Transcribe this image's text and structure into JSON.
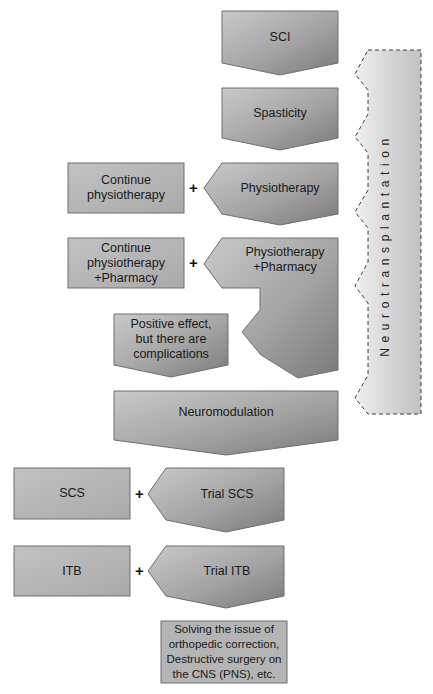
{
  "diagram": {
    "type": "flowchart",
    "colors": {
      "box_dark": "#8a8a8a",
      "box_light": "#d6d6d6",
      "rect_fill": "#b5b5b5",
      "border": "#6e6e6e",
      "side_band_light": "#f2f2f2",
      "side_band_dark": "#c4c4c4"
    },
    "nodes": {
      "sci": "SCI",
      "spasticity": "Spasticity",
      "continue_physio": "Continue\nphysiotherapy",
      "physiotherapy": "Physiotherapy",
      "continue_physio_pharm": "Continue\nphysiotherapy\n+Pharmacy",
      "physio_pharm": "Physiotherapy\n+Pharmacy",
      "positive_effect": "Positive effect,\nbut there are\ncomplications",
      "neuromodulation": "Neuromodulation",
      "scs": "SCS",
      "trial_scs": "Trial SCS",
      "itb": "ITB",
      "trial_itb": "Trial ITB",
      "solving": "Solving the issue of\northopedic correction,\nDestructive surgery on\nthe CNS (PNS), etc."
    },
    "connectors": {
      "plus": "+"
    },
    "side_band": {
      "label": "Neurotransplantation"
    },
    "edges": [
      [
        "SCI",
        "Spasticity"
      ],
      [
        "Spasticity",
        "Physiotherapy"
      ],
      [
        "Physiotherapy",
        "Continue physiotherapy"
      ],
      [
        "Physiotherapy",
        "Physiotherapy +Pharmacy"
      ],
      [
        "Physiotherapy +Pharmacy",
        "Continue physiotherapy +Pharmacy"
      ],
      [
        "Physiotherapy +Pharmacy",
        "Positive effect, but there are complications"
      ],
      [
        "Positive effect, but there are complications",
        "Neuromodulation"
      ],
      [
        "Neuromodulation",
        "Trial SCS"
      ],
      [
        "Trial SCS",
        "SCS"
      ],
      [
        "Trial SCS",
        "Trial ITB"
      ],
      [
        "Trial ITB",
        "ITB"
      ],
      [
        "Trial ITB",
        "Solving the issue of orthopedic correction, Destructive surgery on the CNS (PNS), etc."
      ]
    ]
  }
}
